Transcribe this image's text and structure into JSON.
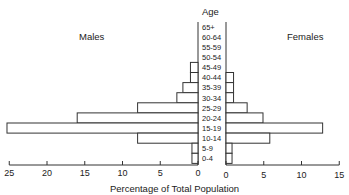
{
  "chart_data": {
    "type": "bar",
    "subtype": "population-pyramid",
    "title": "",
    "xlabel": "Percentage of Total Population",
    "ylabel": "Age",
    "categories": [
      "65+",
      "60-64",
      "55-59",
      "50-54",
      "45-49",
      "40-44",
      "35-39",
      "30-34",
      "25-29",
      "20-24",
      "15-19",
      "10-14",
      "5-9",
      "0-4"
    ],
    "series": [
      {
        "name": "Males",
        "values": [
          0,
          0,
          0,
          0,
          1.0,
          1.0,
          2.0,
          2.8,
          8.0,
          16.0,
          25.3,
          8.0,
          0.8,
          0.8
        ]
      },
      {
        "name": "Females",
        "values": [
          0,
          0,
          0,
          0,
          0,
          1.0,
          1.0,
          1.0,
          2.8,
          4.9,
          12.8,
          5.8,
          0.8,
          0.8
        ]
      }
    ],
    "left_axis": {
      "ticks": [
        25,
        20,
        15,
        10,
        5,
        0
      ],
      "range": [
        25,
        0
      ]
    },
    "right_axis": {
      "ticks": [
        0,
        5,
        10,
        15
      ],
      "range": [
        0,
        15
      ]
    },
    "grid": false,
    "legend": {
      "left": "Males",
      "right": "Females"
    }
  },
  "labels": {
    "age_header": "Age",
    "males": "Males",
    "females": "Females",
    "x_title": "Percentage of Total Population"
  }
}
